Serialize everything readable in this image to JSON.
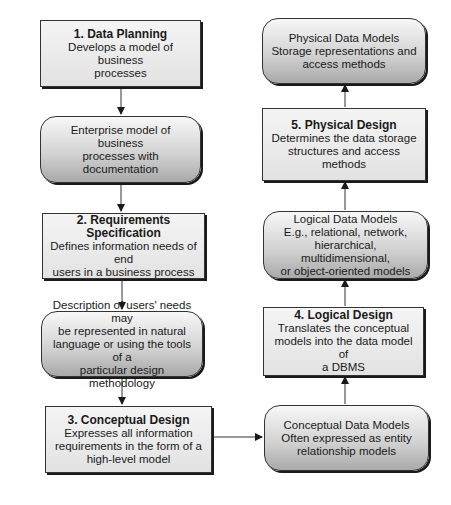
{
  "diagram": {
    "left_column": [
      {
        "id": "data_planning",
        "shape": "rectangle",
        "title": "1. Data Planning",
        "lines": [
          "Develops a model of business",
          "processes"
        ]
      },
      {
        "id": "enterprise_model",
        "shape": "rounded",
        "title": "",
        "lines": [
          "Enterprise model of business",
          "processes with documentation"
        ]
      },
      {
        "id": "requirements_spec",
        "shape": "rectangle",
        "title": "2. Requirements Specification",
        "lines": [
          "Defines information needs of end",
          "users in a business process"
        ]
      },
      {
        "id": "users_needs",
        "shape": "rounded",
        "title": "",
        "lines": [
          "Description of users' needs may",
          "be represented in natural",
          "language or using the tools of a",
          "particular design methodology"
        ]
      },
      {
        "id": "conceptual_design",
        "shape": "rectangle",
        "title": "3. Conceptual Design",
        "lines": [
          "Expresses all information",
          "requirements in the form of a",
          "high-level model"
        ]
      }
    ],
    "right_column": [
      {
        "id": "physical_data_models",
        "shape": "rounded",
        "title": "",
        "lines": [
          "Physical Data Models",
          "Storage representations and",
          "access methods"
        ]
      },
      {
        "id": "physical_design",
        "shape": "rectangle",
        "title": "5. Physical Design",
        "lines": [
          "Determines the data storage",
          "structures and access",
          "methods"
        ]
      },
      {
        "id": "logical_data_models",
        "shape": "rounded",
        "title": "",
        "lines": [
          "Logical Data Models",
          "E.g., relational, network,",
          "hierarchical, multidimensional,",
          "or object-oriented models"
        ]
      },
      {
        "id": "logical_design",
        "shape": "rectangle",
        "title": "4. Logical Design",
        "lines": [
          "Translates the conceptual",
          "models into the data model of",
          "a DBMS"
        ]
      },
      {
        "id": "conceptual_data_models",
        "shape": "rounded",
        "title": "",
        "lines": [
          "Conceptual Data Models",
          "Often expressed as entity",
          "relationship models"
        ]
      }
    ],
    "flow": [
      "data_planning",
      "enterprise_model",
      "requirements_spec",
      "users_needs",
      "conceptual_design",
      "conceptual_data_models",
      "logical_design",
      "logical_data_models",
      "physical_design",
      "physical_data_models"
    ]
  }
}
